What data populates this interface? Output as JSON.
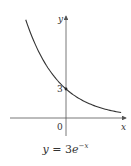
{
  "chart_data": {
    "type": "line",
    "title": "",
    "function": "y = 3e^{-x}",
    "caption": {
      "lhs": "y",
      "eq": " = 3",
      "base": "e",
      "exp": "−x"
    },
    "xlabel": "x",
    "ylabel": "y",
    "xlim": [
      -1.22,
      1.8
    ],
    "ylim": [
      -0.6,
      10.2
    ],
    "grid": false,
    "legend": null,
    "tick_labels": {
      "origin": "0",
      "y_intercept": "3"
    },
    "annotations": [
      {
        "type": "point",
        "x": 0,
        "y": 3,
        "label": "3"
      }
    ],
    "series": [
      {
        "name": "3e^{-x}",
        "x": [
          -1.22,
          -1.0,
          -0.75,
          -0.5,
          -0.25,
          0,
          0.25,
          0.5,
          0.75,
          1.0,
          1.25,
          1.5,
          1.67
        ],
        "y": [
          10.16,
          8.15,
          6.35,
          4.95,
          3.85,
          3.0,
          2.34,
          1.82,
          1.42,
          1.1,
          0.86,
          0.67,
          0.57
        ]
      }
    ]
  },
  "layout": {
    "origin_px": [
      66,
      118
    ],
    "px_per_x": 33,
    "px_per_y": 9.67,
    "x_axis_px": [
      10,
      126
    ],
    "y_axis_px": [
      136,
      16
    ],
    "colors": {
      "axis": "#555555",
      "curve": "#333333",
      "text": "#333333"
    }
  },
  "labels": {
    "x": "x",
    "y": "y",
    "zero": "0",
    "three": "3"
  }
}
